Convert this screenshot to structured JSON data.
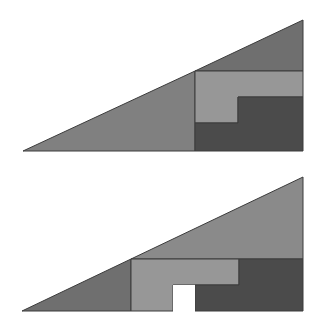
{
  "colors": {
    "red_triangle": "#6f6f6f",
    "blue_triangle": "#808080",
    "green_piece": "#979797",
    "orange_piece": "#4b4b4b",
    "outline": "#3c3c3c",
    "background": "#ffffff"
  },
  "figures": [
    {
      "name": "top-arrangement",
      "pieces": [
        {
          "name": "large-triangle",
          "color": "#808080",
          "points": "23,151 195,71 195,151"
        },
        {
          "name": "small-triangle",
          "color": "#6f6f6f",
          "points": "195,71 303,20 303,71"
        },
        {
          "name": "light-l-piece",
          "color": "#979797",
          "points": "195,71 303,71 303,97 238,97 238,123 195,123"
        },
        {
          "name": "dark-l-piece",
          "color": "#4b4b4b",
          "points": "238,97 303,97 303,151 195,151 195,123 238,123"
        }
      ]
    },
    {
      "name": "bottom-arrangement",
      "pieces": [
        {
          "name": "small-triangle",
          "color": "#6f6f6f",
          "points": "22,311 131,259 131,311"
        },
        {
          "name": "large-triangle",
          "color": "#8a8a8a",
          "points": "131,259 303,177 303,259"
        },
        {
          "name": "light-l-piece",
          "color": "#979797",
          "points": "131,259 239,259 239,285 173,285 173,311 131,311"
        },
        {
          "name": "dark-l-piece",
          "color": "#4b4b4b",
          "points": "239,259 303,259 303,311 195,311 195,285 239,285"
        }
      ],
      "hole": {
        "x": 173,
        "y": 285,
        "width": 22,
        "height": 26
      }
    }
  ]
}
